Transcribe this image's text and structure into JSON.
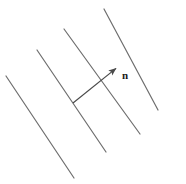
{
  "figure": {
    "background_color": "#ffffff",
    "line_color": "#6e6e6e",
    "arrow_color": "#4a4a4a",
    "label_color": "#1a1a1a",
    "canvas": {
      "width": 186,
      "height": 184
    }
  },
  "wavefronts": {
    "description": "four parallel slanted lines",
    "stroke_color": "#6e6e6e",
    "stroke_width": 1.2,
    "lines": [
      {
        "name": "wavefront-line-1",
        "x1": 6,
        "y1": 76,
        "x2": 74,
        "y2": 178
      },
      {
        "name": "wavefront-line-2",
        "x1": 37,
        "y1": 50,
        "x2": 106,
        "y2": 152
      },
      {
        "name": "wavefront-line-3",
        "x1": 64,
        "y1": 29,
        "x2": 140,
        "y2": 134
      },
      {
        "name": "wavefront-line-4",
        "x1": 104,
        "y1": 9,
        "x2": 158,
        "y2": 110
      }
    ]
  },
  "normal_vector": {
    "name": "normal-arrow",
    "label": "n",
    "label_x": 122,
    "label_y": 70,
    "tail_x": 73,
    "tail_y": 103,
    "tip_x": 119,
    "tip_y": 66,
    "stroke_color": "#4a4a4a",
    "stroke_width": 1.2,
    "head_length": 9,
    "head_width": 5
  },
  "right_angle_marker": {
    "name": "perpendicular-corner-marker",
    "vertex_x": 73,
    "vertex_y": 103,
    "stroke_color": "#6e6e6e",
    "stroke_width": 1.2
  }
}
